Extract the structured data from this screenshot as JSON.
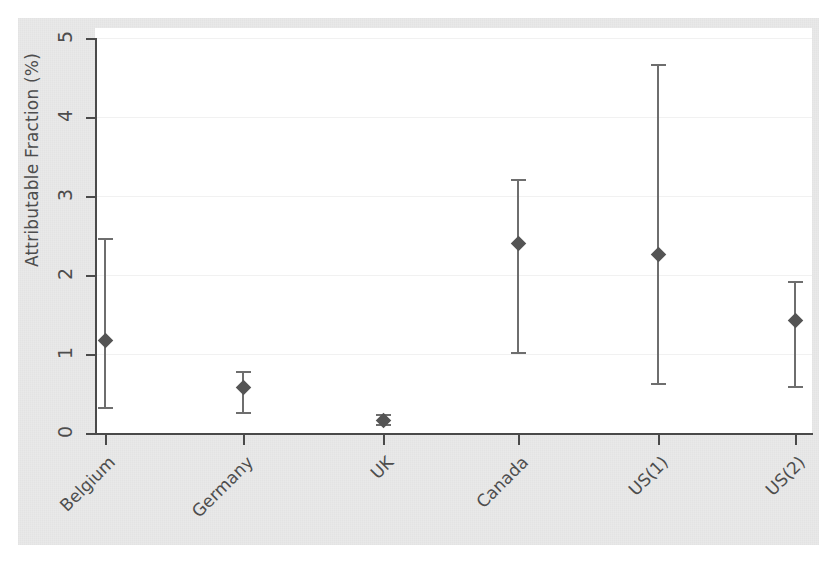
{
  "chart_data": {
    "type": "scatter",
    "title": "",
    "subtitle": "",
    "xlabel": "",
    "ylabel": "Attributable Fraction (%)",
    "categories": [
      "Belgium",
      "Germany",
      "UK",
      "Canada",
      "US(1)",
      "US(2)"
    ],
    "values": [
      1.18,
      0.58,
      0.17,
      2.4,
      2.26,
      1.43
    ],
    "ci_low": [
      0.33,
      0.26,
      0.12,
      1.02,
      0.63,
      0.6
    ],
    "ci_high": [
      2.47,
      0.78,
      0.24,
      3.21,
      4.67,
      1.92
    ],
    "ylim": [
      0,
      5
    ],
    "yticks": [
      0,
      1,
      2,
      3,
      4,
      5
    ],
    "ytick_labels": [
      "0",
      "1",
      "2",
      "3",
      "4",
      "5"
    ],
    "grid": "horizontal",
    "legend": "none",
    "marker": "diamond",
    "error_bars": "95% confidence interval",
    "series": [
      {
        "name": "Attributable Fraction (%)",
        "points": [
          {
            "category": "Belgium",
            "value": 1.18,
            "ci_low": 0.33,
            "ci_high": 2.47
          },
          {
            "category": "Germany",
            "value": 0.58,
            "ci_low": 0.26,
            "ci_high": 0.78
          },
          {
            "category": "UK",
            "value": 0.17,
            "ci_low": 0.12,
            "ci_high": 0.24
          },
          {
            "category": "Canada",
            "value": 2.4,
            "ci_low": 1.02,
            "ci_high": 3.21
          },
          {
            "category": "US(1)",
            "value": 2.26,
            "ci_low": 0.63,
            "ci_high": 4.67
          },
          {
            "category": "US(2)",
            "value": 1.43,
            "ci_low": 0.6,
            "ci_high": 1.92
          }
        ]
      }
    ],
    "colors": {
      "marker": "#545454",
      "error_bar": "#6e6e6e",
      "axis": "#4a4a4a",
      "gridline": "#f1f1f1",
      "plot_background": "#ffffff",
      "canvas_background": "#e9e9e9",
      "text": "#4d4d4d"
    }
  }
}
